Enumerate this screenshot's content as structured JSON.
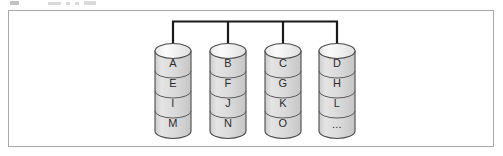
{
  "figure": {
    "title_fragment_visible": false,
    "frame": {
      "border_color": "#a8a8a8",
      "background": "#ffffff"
    }
  },
  "bus": {
    "name": "connection-bus",
    "color": "#1a1a1a",
    "orientation": "horizontal-tree",
    "branch_count": 4
  },
  "style": {
    "cylinder_body_color": "#d9d9d9",
    "cylinder_top_color": "#f2f2f2",
    "cylinder_outline_color": "#4a4a4a",
    "segment_divider_color": "#5a5a5a",
    "label_color": "#2b2b2b"
  },
  "nodes": [
    {
      "id": "node-1",
      "name": "database-cylinder-1",
      "segments": [
        "A",
        "E",
        "I",
        "M"
      ]
    },
    {
      "id": "node-2",
      "name": "database-cylinder-2",
      "segments": [
        "B",
        "F",
        "J",
        "N"
      ]
    },
    {
      "id": "node-3",
      "name": "database-cylinder-3",
      "segments": [
        "C",
        "G",
        "K",
        "O"
      ]
    },
    {
      "id": "node-4",
      "name": "database-cylinder-4",
      "segments": [
        "D",
        "H",
        "L",
        "..."
      ]
    }
  ],
  "labels": {
    "n1s1": "A",
    "n1s2": "E",
    "n1s3": "I",
    "n1s4": "M",
    "n2s1": "B",
    "n2s2": "F",
    "n2s3": "J",
    "n2s4": "N",
    "n3s1": "C",
    "n3s2": "G",
    "n3s3": "K",
    "n3s4": "O",
    "n4s1": "D",
    "n4s2": "H",
    "n4s3": "L",
    "n4s4": "..."
  }
}
